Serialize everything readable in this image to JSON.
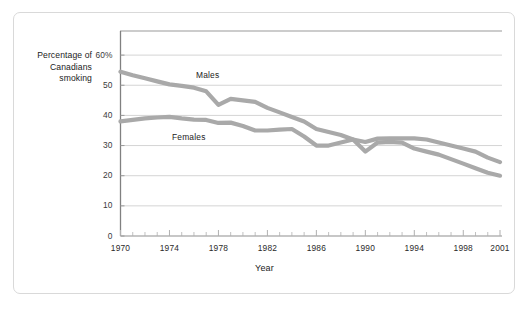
{
  "figure": {
    "background_color": "#ffffff",
    "border_color": "#d9d9d9"
  },
  "axis_titles": {
    "y_line1": "Percentage of",
    "y_line2": "Canadians",
    "y_line3": "smoking",
    "x": "Year"
  },
  "chart_data": {
    "type": "line",
    "title": "",
    "subtitle": "",
    "xlabel": "Year",
    "ylabel": "Percentage of Canadians smoking",
    "xlim": [
      1970,
      2001
    ],
    "ylim": [
      0,
      68
    ],
    "ytick_labels": [
      "60%",
      "50",
      "40",
      "30",
      "20",
      "10",
      "0"
    ],
    "ytick_values": [
      60,
      50,
      40,
      30,
      20,
      10,
      0
    ],
    "xtick_labels": [
      "1970",
      "1974",
      "1978",
      "1982",
      "1986",
      "1990",
      "1994",
      "1998",
      "2001"
    ],
    "xtick_values": [
      1970,
      1974,
      1978,
      1982,
      1986,
      1990,
      1994,
      1998,
      2001
    ],
    "minor_xticks_every": 1,
    "grid": "horizontal",
    "grid_color": "#cfcfcf",
    "legend_position": "inline-annotations",
    "line_color": "#a9a9a9",
    "line_width": 4.2,
    "x": [
      1970,
      1971,
      1972,
      1973,
      1974,
      1975,
      1976,
      1977,
      1978,
      1979,
      1980,
      1981,
      1982,
      1983,
      1984,
      1985,
      1986,
      1987,
      1988,
      1989,
      1990,
      1991,
      1992,
      1993,
      1994,
      1995,
      1996,
      1997,
      1998,
      1999,
      2000,
      2001
    ],
    "series": [
      {
        "name": "Males",
        "color": "#a9a9a9",
        "values": [
          54.5,
          53.3,
          52.3,
          51.3,
          50.3,
          49.8,
          49.2,
          48.0,
          43.5,
          45.5,
          45.0,
          44.5,
          42.5,
          41.0,
          39.5,
          38.0,
          35.5,
          34.5,
          33.5,
          32.0,
          28.0,
          31.0,
          31.2,
          31.0,
          29.0,
          28.0,
          27.0,
          25.5,
          24.0,
          22.5,
          21.0,
          20.0
        ]
      },
      {
        "name": "Females",
        "color": "#a9a9a9",
        "values": [
          38.0,
          38.5,
          39.0,
          39.3,
          39.5,
          39.0,
          38.6,
          38.5,
          37.5,
          37.6,
          36.5,
          35.0,
          35.0,
          35.3,
          35.5,
          33.0,
          30.0,
          30.0,
          31.0,
          32.0,
          31.2,
          32.3,
          32.4,
          32.4,
          32.4,
          32.0,
          31.0,
          30.0,
          29.0,
          28.0,
          26.0,
          24.5
        ]
      }
    ],
    "annotations": [
      {
        "text": "Males",
        "x": 1978,
        "y": 52
      },
      {
        "text": "Females",
        "x": 1976,
        "y": 33.5
      }
    ]
  }
}
